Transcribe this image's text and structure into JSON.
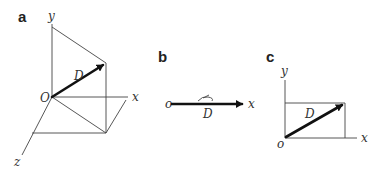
{
  "figure": {
    "panels": [
      {
        "id": "a",
        "label": "a",
        "axes": {
          "x": "x",
          "y": "y",
          "z": "z"
        },
        "origin_label": "O",
        "vector_label": "D",
        "description": "3D vector D from origin with projection box lines"
      },
      {
        "id": "b",
        "label": "b",
        "axes": {
          "x": "x"
        },
        "origin_label": "o",
        "vector_label": "D",
        "annotation": "hand-drawn scribble above arrow",
        "description": "1D vector D along x-axis"
      },
      {
        "id": "c",
        "label": "c",
        "axes": {
          "x": "x",
          "y": "y"
        },
        "origin_label": "o",
        "vector_label": "D",
        "description": "2D vector D with rectangle projections"
      }
    ]
  }
}
